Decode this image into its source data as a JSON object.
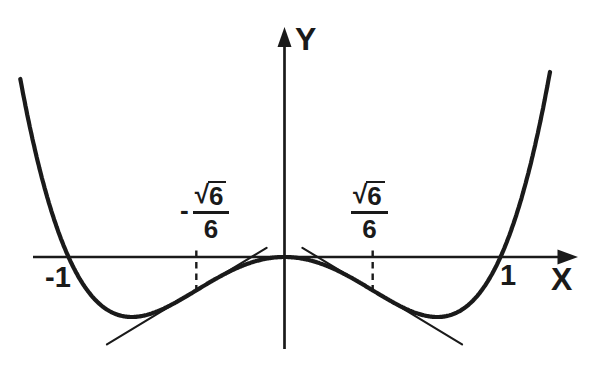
{
  "figure": {
    "ink_color": "#1a1a1a",
    "background_color": "#ffffff"
  },
  "labels": {
    "y_axis": "Y",
    "x_axis": "X",
    "x_tick_neg": "-1",
    "x_tick_pos": "1",
    "left_inflection": {
      "sign": "-",
      "radical": "√",
      "radicand": "6",
      "denominator": "6",
      "value_text": "-√6/6"
    },
    "right_inflection": {
      "radical": "√",
      "radicand": "6",
      "denominator": "6",
      "value_text": "√6/6"
    }
  },
  "chart_data": {
    "type": "line",
    "title": "",
    "xlabel": "X",
    "ylabel": "Y",
    "grid": false,
    "legend": false,
    "axis_range_x": [
      -1.3,
      1.36
    ],
    "axis_range_y": [
      -0.47,
      0.96
    ],
    "curve": {
      "expression": "y = x^4 - x^2",
      "polynomial_coefficients": [
        0,
        0,
        -1,
        0,
        1
      ],
      "x_range": [
        -1.223,
        1.229
      ]
    },
    "samples": {
      "x": [
        -1.2,
        -1.1,
        -1.0,
        -0.9,
        -0.8,
        -0.7,
        -0.6,
        -0.5,
        -0.4,
        -0.3,
        -0.2,
        -0.1,
        0,
        0.1,
        0.2,
        0.3,
        0.4,
        0.5,
        0.6,
        0.7,
        0.8,
        0.9,
        1.0,
        1.1,
        1.2
      ],
      "y": [
        0.6336,
        0.2541,
        0,
        -0.1539,
        -0.2304,
        -0.2499,
        -0.2304,
        -0.1875,
        -0.1344,
        -0.0819,
        -0.0384,
        -0.0099,
        0,
        -0.0099,
        -0.0384,
        -0.0819,
        -0.1344,
        -0.1875,
        -0.2304,
        -0.2499,
        -0.2304,
        -0.1539,
        0,
        0.2541,
        0.6336
      ]
    },
    "x_intercepts": [
      -1,
      0,
      1
    ],
    "x_tick_labels": [
      "-1",
      "1"
    ],
    "local_minima": [
      {
        "x": -0.7071,
        "y": -0.25
      },
      {
        "x": 0.7071,
        "y": -0.25
      }
    ],
    "local_maximum": {
      "x": 0,
      "y": 0
    },
    "inflection_points": [
      {
        "x": -0.40825,
        "y": -0.13889,
        "label": "-√6/6",
        "marker": "dashed-vertical"
      },
      {
        "x": 0.40825,
        "y": -0.13889,
        "label": "√6/6",
        "marker": "dashed-vertical"
      }
    ],
    "tangent_lines": [
      {
        "at_x": -0.40825,
        "slope": 0.54433,
        "x_span": [
          -0.822,
          -0.083
        ]
      },
      {
        "at_x": 0.40825,
        "slope": -0.54433,
        "x_span": [
          0.083,
          0.822
        ]
      }
    ]
  }
}
